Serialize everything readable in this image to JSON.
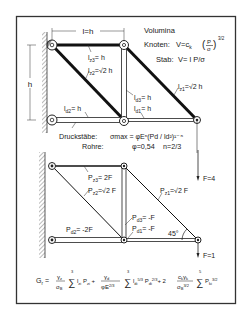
{
  "colors": {
    "ink": "#1a1a1a",
    "paper": "#ffffff",
    "hatch": "#555555",
    "frame": "#333333"
  },
  "top_truss": {
    "dim_length": "l=h",
    "dim_height": "h",
    "labels": {
      "lz3": "l",
      "lz3_sub": "z3",
      "lz3_val": "= h",
      "lz2": "l",
      "lz2_sub": "z2",
      "lz2_val": "=√2 h",
      "lz1": "l",
      "lz1_sub": "z1",
      "lz1_val": "=√2 h",
      "ld3": "l",
      "ld3_sub": "d3",
      "ld3_val": "= h",
      "ld2": "l",
      "ld2_sub": "d2",
      "ld2_val": "= h",
      "ld1": "l",
      "ld1_sub": "d1",
      "ld1_val": "= h"
    }
  },
  "volumina": {
    "title": "Volumina",
    "knoten_label": "Knoten:",
    "knoten_formula": "V=c",
    "knoten_sub": "k",
    "knoten_frac_num": "P",
    "knoten_frac_den": "σ",
    "knoten_exp": "3/2",
    "stab_label": "Stab:",
    "stab_formula": "V= l P/σ"
  },
  "druckstaebe": {
    "label": "Druckstäbe:",
    "formula": "σmax = φEⁿ(Pd / ld²)¹⁻ⁿ",
    "rohre_label": "Rohre:",
    "phi": "φ=0,54",
    "n": "n=2/3"
  },
  "bottom_truss": {
    "labels": {
      "pz3": "P",
      "pz3_sub": "z3",
      "pz3_val": "= 2F",
      "pz2": "P",
      "pz2_sub": "z2",
      "pz2_val": "=√2 F",
      "pz1": "P",
      "pz1_sub": "z1",
      "pz1_val": "=√2 F",
      "pd3": "P",
      "pd3_sub": "d3",
      "pd3_val": "= -F",
      "pd2": "P",
      "pd2_sub": "d2",
      "pd2_val": "= -2F",
      "pd1": "P",
      "pd1_sub": "d1",
      "pd1_val": "= -F"
    },
    "angle": "45°",
    "force_top": "F=4",
    "force_bottom": "F=1"
  },
  "formula_total": {
    "lhs": "G",
    "lhs_sub": "r",
    "text": "= γz/σB Σ(i=1..3) lzi Pzi + γd/(φE^2/3) Σ(i=1..3) ldi^5/3 Pdi^2/3 + 2 ckγk/σB^3/2 Σ(i=1..5) Pki^3/2"
  }
}
